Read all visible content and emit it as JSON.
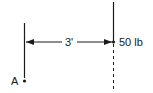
{
  "diagram": {
    "dimension_label": "3'",
    "force_label": "50 lb",
    "point_label": "A",
    "colors": {
      "line": "#1a1a1a",
      "background": "#ffffff"
    }
  }
}
